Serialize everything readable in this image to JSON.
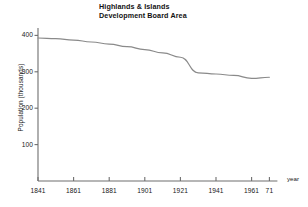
{
  "chart_data": {
    "type": "line",
    "title_line1": "Highlands & Islands",
    "title_line2": "Development Board Area",
    "xlabel": "year",
    "ylabel": "Population (thousands)",
    "xlim": [
      1841,
      1971
    ],
    "ylim": [
      0,
      420
    ],
    "grid": false,
    "legend": false,
    "x_ticks": [
      {
        "value": 1841,
        "label": "1841"
      },
      {
        "value": 1861,
        "label": "1861"
      },
      {
        "value": 1881,
        "label": "1881"
      },
      {
        "value": 1901,
        "label": "1901"
      },
      {
        "value": 1921,
        "label": "1921"
      },
      {
        "value": 1941,
        "label": "1941"
      },
      {
        "value": 1961,
        "label": "1961"
      },
      {
        "value": 1971,
        "label": "71"
      }
    ],
    "y_ticks": [
      {
        "value": 100,
        "label": "100"
      },
      {
        "value": 200,
        "label": "200"
      },
      {
        "value": 300,
        "label": "300"
      },
      {
        "value": 400,
        "label": "400"
      }
    ],
    "line_color": "#8a8a8a",
    "axis_color": "#6e6e6e",
    "x": [
      1841,
      1851,
      1861,
      1871,
      1881,
      1891,
      1901,
      1911,
      1921,
      1931,
      1941,
      1951,
      1961,
      1971
    ],
    "values": [
      393,
      391,
      387,
      382,
      376,
      369,
      361,
      352,
      340,
      297,
      294,
      290,
      282,
      285
    ],
    "series": [
      {
        "name": "Population",
        "values": [
          393,
          391,
          387,
          382,
          376,
          369,
          361,
          352,
          340,
          297,
          294,
          290,
          282,
          285
        ]
      }
    ]
  }
}
